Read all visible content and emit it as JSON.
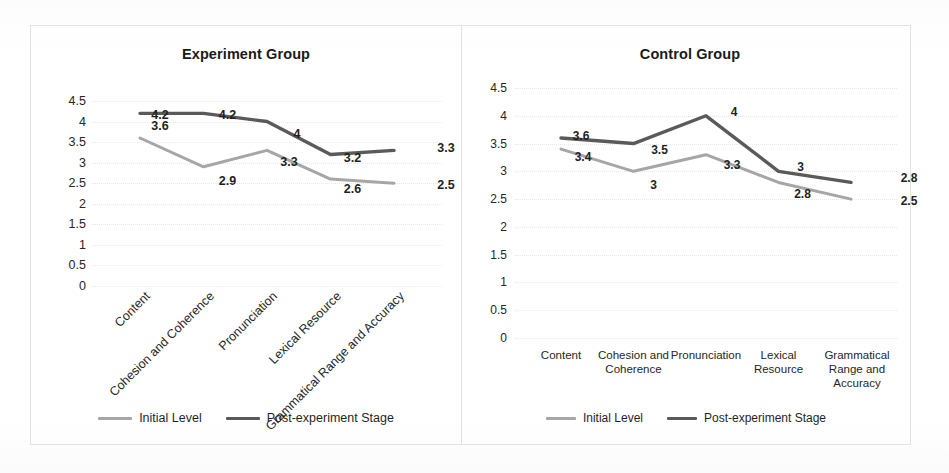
{
  "figure": {
    "series_colors": {
      "initial": "#a6a6a6",
      "post": "#5a5a5a"
    },
    "legend": {
      "initial_label": "Initial Level",
      "post_label": "Post-experiment Stage"
    }
  },
  "chart_data": [
    {
      "type": "line",
      "title": "Experiment Group",
      "xlabel": "",
      "ylabel": "",
      "ylim": [
        0,
        4.5
      ],
      "yticks": [
        "4.5",
        "4",
        "3.5",
        "3",
        "2.5",
        "2",
        "1.5",
        "1",
        "0.5",
        "0"
      ],
      "grid": true,
      "legend_position": "bottom",
      "xlabel_rotation": -45,
      "categories": [
        "Content",
        "Cohesion and Coherence",
        "Pronunciation",
        "Lexical Resource",
        "Grammatical Range and Accuracy"
      ],
      "series": [
        {
          "name": "Initial Level",
          "color": "#a6a6a6",
          "values": [
            3.6,
            2.9,
            3.3,
            2.6,
            2.5
          ],
          "labels": [
            "3.6",
            "2.9",
            "3.3",
            "2.6",
            "2.5"
          ]
        },
        {
          "name": "Post-experiment Stage",
          "color": "#5a5a5a",
          "values": [
            4.2,
            4.2,
            4,
            3.2,
            3.3
          ],
          "labels": [
            "4.2",
            "4.2",
            "4",
            "3.2",
            "3.3"
          ]
        }
      ]
    },
    {
      "type": "line",
      "title": "Control Group",
      "xlabel": "",
      "ylabel": "",
      "ylim": [
        0,
        4.5
      ],
      "yticks": [
        "4.5",
        "4",
        "3.5",
        "3",
        "2.5",
        "2",
        "1.5",
        "1",
        "0.5",
        "0"
      ],
      "grid": true,
      "legend_position": "bottom",
      "xlabel_rotation": 0,
      "categories": [
        "Content",
        "Cohesion and Coherence",
        "Pronunciation",
        "Lexical Resource",
        "Grammatical Range and Accuracy"
      ],
      "series": [
        {
          "name": "Initial Level",
          "color": "#a6a6a6",
          "values": [
            3.4,
            3,
            3.3,
            2.8,
            2.5
          ],
          "labels": [
            "3.4",
            "3",
            "3.3",
            "2.8",
            "2.5"
          ]
        },
        {
          "name": "Post-experiment Stage",
          "color": "#5a5a5a",
          "values": [
            3.6,
            3.5,
            4,
            3,
            2.8
          ],
          "labels": [
            "3.6",
            "3.5",
            "4",
            "3",
            "2.8"
          ]
        }
      ]
    }
  ]
}
